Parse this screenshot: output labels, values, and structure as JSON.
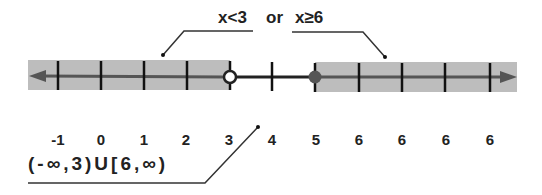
{
  "diagram": {
    "title_parts": {
      "left_inequality": "x<3",
      "connector": "or",
      "right_inequality": "x≥6"
    },
    "interval_notation": "(-∞,3)U[6,∞)",
    "tick_labels": [
      "-1",
      "0",
      "1",
      "2",
      "3",
      "4",
      "5",
      "6",
      "6",
      "6",
      "6"
    ],
    "open_circle_at": "3",
    "closed_circle_at": "5",
    "colors": {
      "shade": "#bdbdbd",
      "line": "#333333",
      "shaded_line": "#555555",
      "tick": "#111111",
      "closed_point": "#555555",
      "open_point_fill": "#ffffff"
    }
  }
}
